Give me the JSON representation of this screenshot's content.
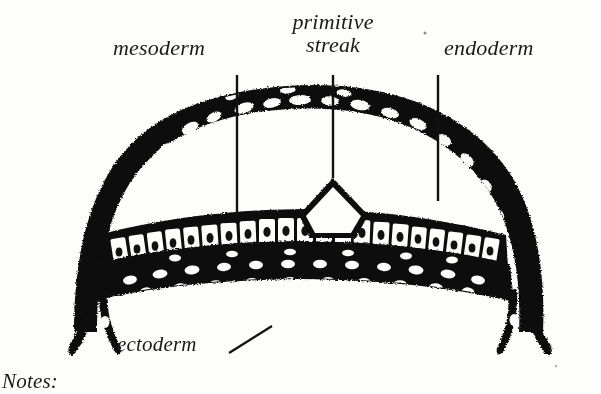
{
  "figure": {
    "kind": "histology-cross-section",
    "background_color": "#fdfdfc",
    "ink_color": "#111111"
  },
  "labels": {
    "mesoderm": "mesoderm",
    "primitive_streak_line1": "primitive",
    "primitive_streak_line2": "streak",
    "endoderm": "endoderm",
    "ectoderm": "ectoderm"
  },
  "notes": {
    "heading": "Notes:"
  },
  "leader_lines": {
    "mesoderm": "vertical",
    "primitive_streak": "vertical",
    "endoderm": "vertical",
    "ectoderm": "diagonal"
  }
}
